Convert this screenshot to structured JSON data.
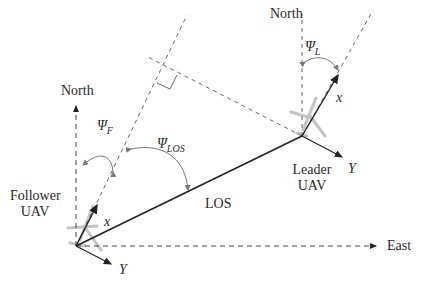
{
  "diagram": {
    "type": "UAV leader-follower line-of-sight geometry",
    "labels": {
      "north_follower": "North",
      "north_leader": "North",
      "east": "East",
      "follower_line1": "Follower",
      "follower_line2": "UAV",
      "leader_line1": "Leader",
      "leader_line2": "UAV",
      "los": "LOS",
      "psi_f_symbol": "Ψ",
      "psi_f_sub": "F",
      "psi_los_symbol": "Ψ",
      "psi_los_sub": "LOS",
      "psi_l_symbol": "Ψ",
      "psi_l_sub": "L",
      "x_follower": "x",
      "y_follower": "Y",
      "x_leader": "x",
      "y_leader": "Y"
    },
    "colors": {
      "line": "#222222",
      "dashed": "#555555",
      "arc": "#777777",
      "aircraft": "#bbbbbb"
    }
  }
}
